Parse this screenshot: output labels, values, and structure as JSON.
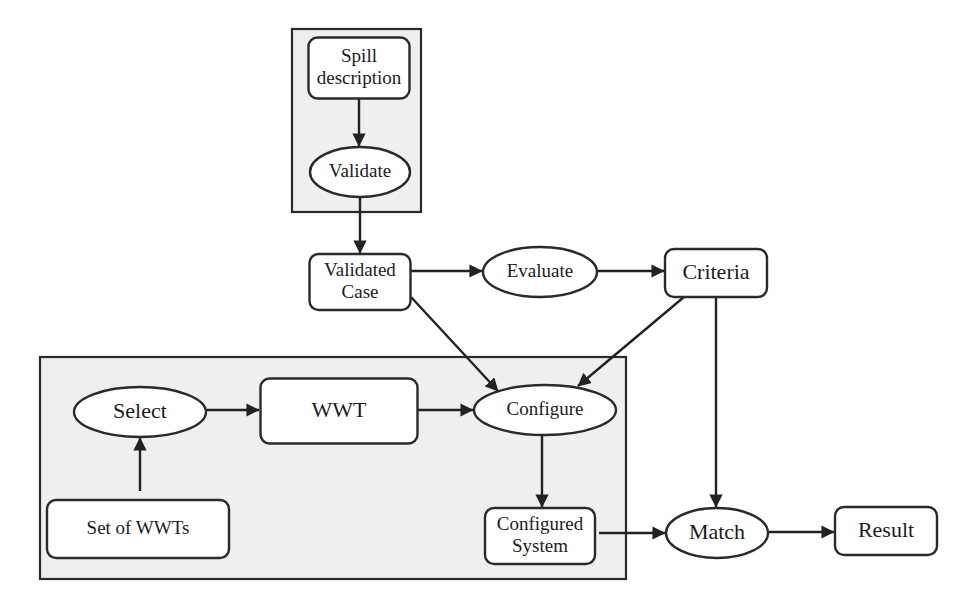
{
  "diagram": {
    "groups": [
      {
        "id": "input-group"
      },
      {
        "id": "configuration-group"
      }
    ],
    "nodes": [
      {
        "id": "spill-description",
        "shape": "rect",
        "lines": [
          "Spill",
          "description"
        ]
      },
      {
        "id": "validate",
        "shape": "ellipse",
        "lines": [
          "Validate"
        ]
      },
      {
        "id": "validated-case",
        "shape": "rect",
        "lines": [
          "Validated",
          "Case"
        ]
      },
      {
        "id": "evaluate",
        "shape": "ellipse",
        "lines": [
          "Evaluate"
        ]
      },
      {
        "id": "criteria",
        "shape": "rect",
        "lines": [
          "Criteria"
        ]
      },
      {
        "id": "select",
        "shape": "ellipse",
        "lines": [
          "Select"
        ]
      },
      {
        "id": "wwt",
        "shape": "rect",
        "lines": [
          "WWT"
        ]
      },
      {
        "id": "configure",
        "shape": "ellipse",
        "lines": [
          "Configure"
        ]
      },
      {
        "id": "set-of-wwts",
        "shape": "rect",
        "lines": [
          "Set of WWTs"
        ]
      },
      {
        "id": "configured-system",
        "shape": "rect",
        "lines": [
          "Configured",
          "System"
        ]
      },
      {
        "id": "match",
        "shape": "ellipse",
        "lines": [
          "Match"
        ]
      },
      {
        "id": "result",
        "shape": "rect",
        "lines": [
          "Result"
        ]
      }
    ],
    "edges": [
      {
        "from": "spill-description",
        "to": "validate"
      },
      {
        "from": "validate",
        "to": "validated-case"
      },
      {
        "from": "validated-case",
        "to": "evaluate"
      },
      {
        "from": "evaluate",
        "to": "criteria"
      },
      {
        "from": "validated-case",
        "to": "configure"
      },
      {
        "from": "criteria",
        "to": "configure"
      },
      {
        "from": "criteria",
        "to": "match"
      },
      {
        "from": "set-of-wwts",
        "to": "select"
      },
      {
        "from": "select",
        "to": "wwt"
      },
      {
        "from": "wwt",
        "to": "configure"
      },
      {
        "from": "configure",
        "to": "configured-system"
      },
      {
        "from": "configured-system",
        "to": "match"
      },
      {
        "from": "match",
        "to": "result"
      }
    ]
  }
}
